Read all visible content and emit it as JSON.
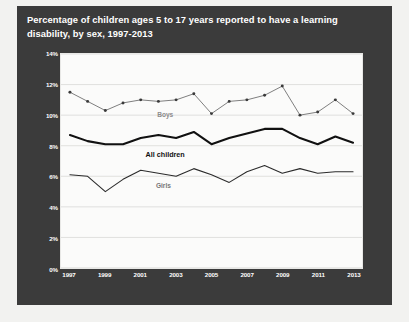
{
  "chart_data": {
    "type": "line",
    "title": "Percentage of children ages 5 to 17 years reported to have a learning disability, by sex, 1997-2013",
    "xlabel": "",
    "ylabel": "",
    "ylim": [
      0,
      14
    ],
    "xlim": [
      1997,
      2013
    ],
    "ytick_labels": [
      "0%",
      "2%",
      "4%",
      "6%",
      "8%",
      "10%",
      "12%",
      "14%"
    ],
    "ytick_values": [
      0,
      2,
      4,
      6,
      8,
      10,
      12,
      14
    ],
    "xtick_labels": [
      "1997",
      "1999",
      "2001",
      "2003",
      "2005",
      "2007",
      "2009",
      "2011",
      "2013"
    ],
    "xtick_values": [
      1997,
      1999,
      2001,
      2003,
      2005,
      2007,
      2009,
      2011,
      2013
    ],
    "grid": true,
    "legend_position": "inline-labels",
    "x": [
      1997,
      1998,
      1999,
      2000,
      2001,
      2002,
      2003,
      2004,
      2005,
      2006,
      2007,
      2008,
      2009,
      2010,
      2011,
      2012,
      2013
    ],
    "series": [
      {
        "name": "Boys",
        "color": "#6f6f6f",
        "line_width": 0.9,
        "markers": true,
        "values": [
          11.5,
          10.9,
          10.3,
          10.8,
          11.0,
          10.9,
          11.0,
          11.4,
          10.1,
          10.9,
          11.0,
          11.3,
          11.9,
          10.0,
          10.2,
          11.0,
          10.1
        ]
      },
      {
        "name": "All children",
        "color": "#111111",
        "line_width": 2.1,
        "markers": false,
        "values": [
          8.7,
          8.3,
          8.1,
          8.1,
          8.5,
          8.7,
          8.5,
          8.9,
          8.1,
          8.5,
          8.8,
          9.1,
          9.1,
          8.5,
          8.1,
          8.6,
          8.2
        ]
      },
      {
        "name": "Girls",
        "color": "#2b2b2b",
        "line_width": 1.1,
        "markers": false,
        "values": [
          6.1,
          6.0,
          5.0,
          5.8,
          6.4,
          6.2,
          6.0,
          6.5,
          6.1,
          5.6,
          6.3,
          6.7,
          6.2,
          6.5,
          6.2,
          6.3,
          6.3
        ]
      }
    ],
    "annotations": [
      {
        "name": "Boys",
        "x": 2002.4,
        "y": 10.05
      },
      {
        "name": "All children",
        "x": 2002.4,
        "y": 7.45
      },
      {
        "name": "Girls",
        "x": 2002.3,
        "y": 5.45
      }
    ]
  }
}
